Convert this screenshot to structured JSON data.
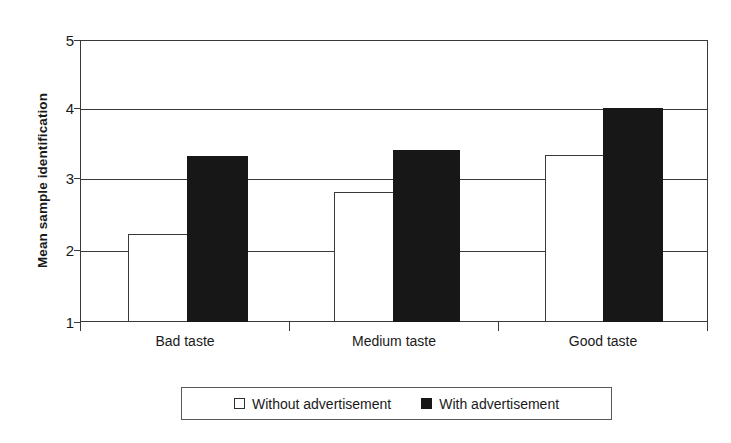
{
  "chart_data": {
    "type": "bar",
    "title": "",
    "xlabel": "",
    "ylabel": "Mean sample identification",
    "categories": [
      "Bad taste",
      "Medium taste",
      "Good taste"
    ],
    "series": [
      {
        "name": "Without advertisement",
        "marker": "open-square",
        "color": "#ffffff",
        "values": [
          2.25,
          2.84,
          3.37
        ]
      },
      {
        "name": "With advertisement",
        "marker": "filled-square",
        "color": "#171717",
        "values": [
          3.35,
          3.44,
          4.04
        ]
      }
    ],
    "ylim": [
      1,
      5
    ],
    "yticks": [
      1,
      2,
      3,
      4,
      5
    ],
    "ytick_labels": [
      "1",
      "2",
      "3",
      "4",
      "5"
    ],
    "grid": true,
    "grid_axis": "y",
    "legend_position": "bottom"
  },
  "axes": {
    "y_title": "Mean sample identification",
    "tick_labels": [
      "5",
      "4",
      "3",
      "2",
      "1"
    ],
    "category_labels": [
      "Bad taste",
      "Medium taste",
      "Good taste"
    ]
  },
  "legend": {
    "entries": [
      {
        "label": "Without advertisement",
        "swatch": "open-square-swatch"
      },
      {
        "label": "With advertisement",
        "swatch": "filled-square-swatch"
      }
    ]
  },
  "colors": {
    "axis": "#3a3a3a",
    "grid": "#3a3a3a",
    "bar_without": "#ffffff",
    "bar_with": "#171717",
    "background": "#ffffff"
  }
}
